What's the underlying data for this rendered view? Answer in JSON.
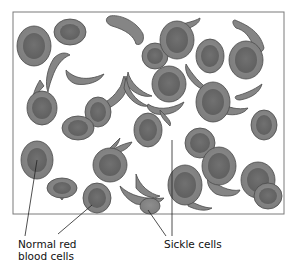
{
  "figure": {
    "labels": {
      "normal": [
        "Normal red",
        "blood cells"
      ],
      "sickle": "Sickle cells"
    },
    "colors": {
      "frame": "#7a7a7a",
      "cell_outer": "#8a8a8a",
      "cell_inner": "#6a6a6a",
      "cell_edge": "#4a4a4a",
      "leader": "#222222"
    }
  }
}
